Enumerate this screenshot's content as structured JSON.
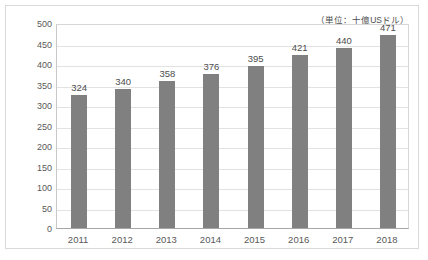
{
  "chart_data": {
    "type": "bar",
    "title": "",
    "subtitle": "",
    "annotation": "（単位：十億USドル）",
    "categories": [
      "2011",
      "2012",
      "2013",
      "2014",
      "2015",
      "2016",
      "2017",
      "2018"
    ],
    "values": [
      324,
      340,
      358,
      376,
      395,
      421,
      440,
      471
    ],
    "value_labels": [
      "324",
      "340",
      "358",
      "376",
      "395",
      "421",
      "440",
      "471"
    ],
    "xlabel": "",
    "ylabel": "",
    "ylim": [
      0,
      500
    ],
    "ytick_step": 50,
    "ytick_labels": [
      "500",
      "450",
      "400",
      "350",
      "300",
      "250",
      "200",
      "150",
      "100",
      "50",
      "0"
    ],
    "ytick_values": [
      500,
      450,
      400,
      350,
      300,
      250,
      200,
      150,
      100,
      50,
      0
    ],
    "grid": "horizontal",
    "legend": "none",
    "colors": {
      "bar": "#808080",
      "gridline": "#e2e2e2",
      "axis": "#a6a6a6",
      "text": "#595959",
      "value_text": "#4d4d4d",
      "frame": "#d9d9d9",
      "background": "#ffffff"
    }
  }
}
